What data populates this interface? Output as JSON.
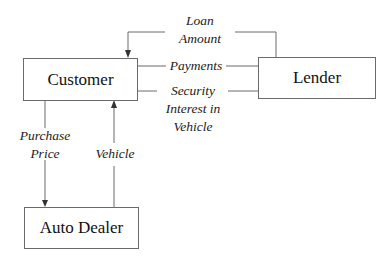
{
  "diagram": {
    "nodes": {
      "customer": {
        "label": "Customer"
      },
      "lender": {
        "label": "Lender"
      },
      "auto_dealer": {
        "label": "Auto Dealer"
      }
    },
    "edges": {
      "loan_amount": {
        "line1": "Loan",
        "line2": "Amount",
        "from": "Lender",
        "to": "Customer"
      },
      "payments": {
        "line1": "Payments",
        "from": "Customer",
        "to": "Lender"
      },
      "security_interest": {
        "line1": "Security",
        "line2": "Interest in",
        "line3": "Vehicle",
        "from": "Customer",
        "to": "Lender"
      },
      "purchase_price": {
        "line1": "Purchase",
        "line2": "Price",
        "from": "Customer",
        "to": "Auto Dealer"
      },
      "vehicle": {
        "line1": "Vehicle",
        "from": "Auto Dealer",
        "to": "Customer"
      }
    },
    "colors": {
      "line": "#6b6b6b",
      "text": "#111111",
      "background": "#ffffff"
    }
  }
}
